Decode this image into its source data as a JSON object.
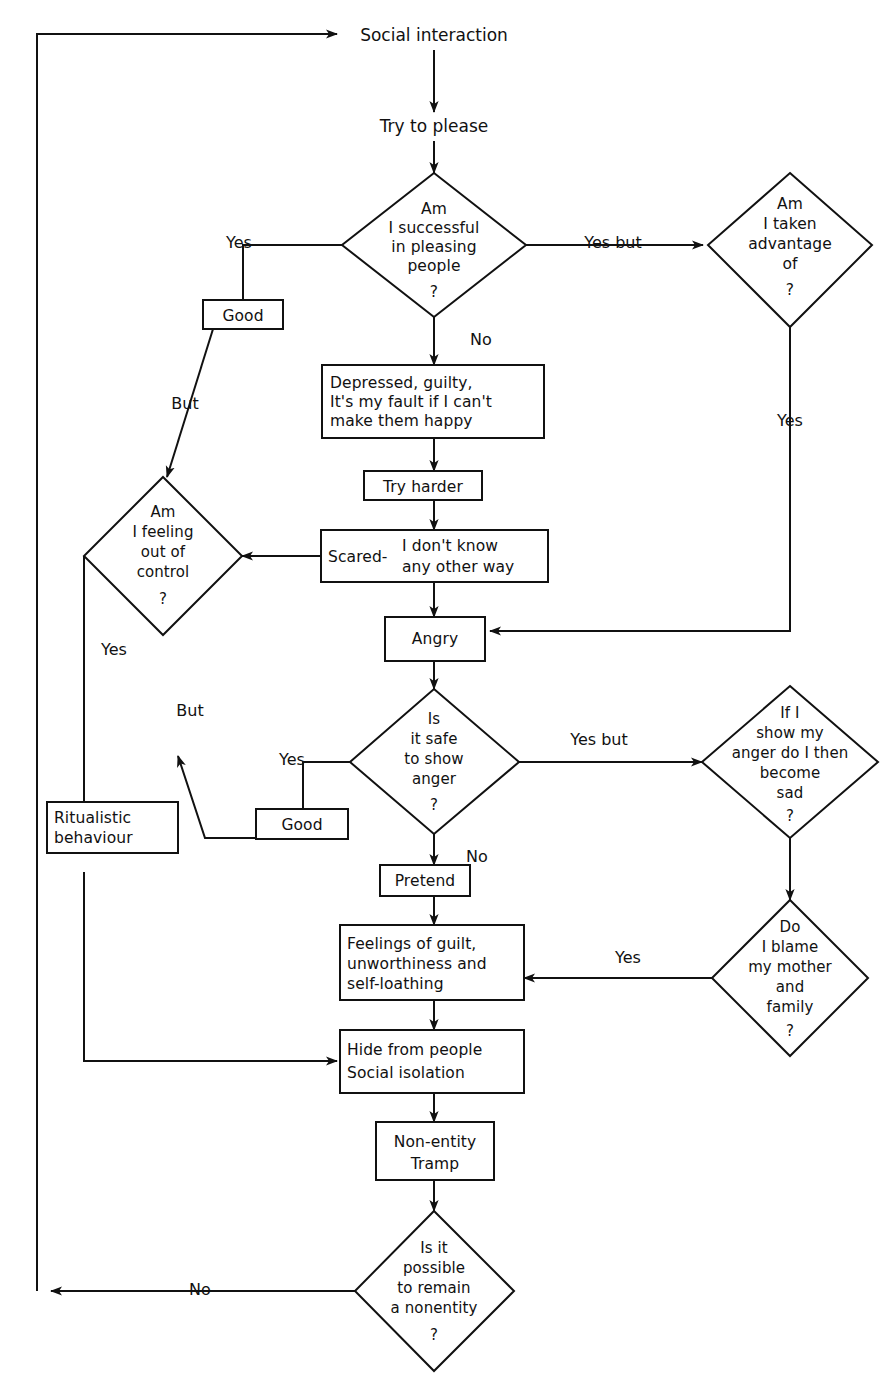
{
  "diagram": {
    "type": "flowchart",
    "background": "#ffffff",
    "line_color": "#111111",
    "text_color": "#111111"
  },
  "nodes": {
    "social_interaction": {
      "label": "Social interaction",
      "shape": "plain"
    },
    "try_to_please": {
      "label": "Try to please",
      "shape": "plain"
    },
    "d_successful": {
      "shape": "diamond",
      "lines": [
        "Am",
        "I successful",
        "in pleasing",
        "people",
        "?"
      ]
    },
    "d_taken_advantage": {
      "shape": "diamond",
      "lines": [
        "Am",
        "I taken",
        "advantage",
        "of",
        "?"
      ]
    },
    "good_1": {
      "label": "Good",
      "shape": "box"
    },
    "d_out_of_control": {
      "shape": "diamond",
      "lines": [
        "Am",
        "I feeling",
        "out of",
        "control",
        "?"
      ]
    },
    "depressed": {
      "shape": "box",
      "lines": [
        "Depressed, guilty,",
        "It's my fault if I can't",
        "make them happy"
      ]
    },
    "try_harder": {
      "label": "Try harder",
      "shape": "box"
    },
    "scared": {
      "shape": "box",
      "left_label": "Scared-",
      "lines": [
        "I don't know",
        "any other way"
      ]
    },
    "angry": {
      "label": "Angry",
      "shape": "box"
    },
    "d_safe_anger": {
      "shape": "diamond",
      "lines": [
        "Is",
        "it safe",
        "to show",
        "anger",
        "?"
      ]
    },
    "d_show_anger_sad": {
      "shape": "diamond",
      "lines": [
        "If I",
        "show my",
        "anger do I then",
        "become",
        "sad",
        "?"
      ]
    },
    "good_2": {
      "label": "Good",
      "shape": "box"
    },
    "ritualistic": {
      "shape": "box",
      "lines": [
        "Ritualistic",
        "behaviour"
      ]
    },
    "pretend": {
      "label": "Pretend",
      "shape": "box"
    },
    "feelings_guilt": {
      "shape": "box",
      "lines": [
        "Feelings of guilt,",
        "unworthiness and",
        "self-loathing"
      ]
    },
    "d_blame_mother": {
      "shape": "diamond",
      "lines": [
        "Do",
        "I blame",
        "my mother",
        "and",
        "family",
        "?"
      ]
    },
    "hide_from_people": {
      "shape": "box",
      "lines": [
        "Hide from people",
        "Social isolation"
      ]
    },
    "non_entity": {
      "shape": "box",
      "lines": [
        "Non-entity",
        "Tramp"
      ]
    },
    "d_remain_nonentity": {
      "shape": "diamond",
      "lines": [
        "Is it",
        "possible",
        "to remain",
        "a nonentity",
        "?"
      ]
    }
  },
  "edge_labels": {
    "yes_1": "Yes",
    "yes_but_1": "Yes but",
    "no_1": "No",
    "but_1": "But",
    "yes_2": "Yes",
    "yes_3": "Yes",
    "but_2": "But",
    "yes_but_2": "Yes but",
    "no_2": "No",
    "yes_4": "Yes",
    "no_3": "No"
  }
}
